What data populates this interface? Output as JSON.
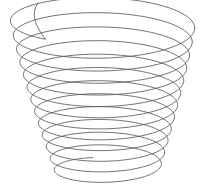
{
  "figure": {
    "title": "Conical helix coil wireframe",
    "background_color": "#ffffff",
    "stroke_color": "#5a5a5a",
    "stroke_width": 0.85,
    "canvas": {
      "width": 207,
      "height": 188
    },
    "geometry": {
      "type": "conical-helix",
      "turns": 12.35,
      "start_angle_deg": 128,
      "center_x_top": 103,
      "center_x_bottom": 107,
      "top_y": 18,
      "bottom_y": 172,
      "radius_x_top": 93,
      "radius_x_bottom": 52,
      "radius_y_top": 27,
      "radius_y_bottom": 15,
      "free_end": {
        "x": 38,
        "y": 3
      },
      "extents": {
        "left": 9,
        "right": 197,
        "top": 2,
        "bottom": 178
      },
      "samples_per_turn": 90
    }
  }
}
